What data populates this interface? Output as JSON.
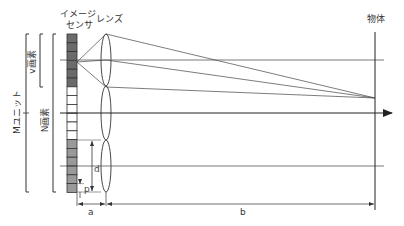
{
  "diagram": {
    "labels": {
      "image_sensor_line1": "イメージ",
      "image_sensor_line2": "センサ",
      "lens": "レンズ",
      "object": "物体",
      "m_unit": "Mユニット",
      "n_pixels": "N画素",
      "v_pixels": "v画素",
      "d": "d",
      "p": "p",
      "a": "a",
      "b": "b"
    },
    "colors": {
      "line": "#333333",
      "sensor_dark": "#6b6b6b",
      "sensor_mid": "#9a9a9a",
      "sensor_light": "#ffffff"
    },
    "sensor": {
      "cells_total": 18,
      "dark_cells": 6,
      "white_cells": 6,
      "gray_cells": 6
    }
  }
}
